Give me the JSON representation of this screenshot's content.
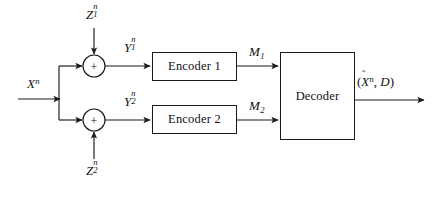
{
  "diagram": {
    "type": "block-diagram",
    "background": "#ffffff",
    "line_color": "#1a1a1a",
    "text_color": "#111111"
  },
  "blocks": [
    {
      "id": "encoder1",
      "label": "Encoder 1",
      "x": 152,
      "y": 52,
      "w": 85,
      "h": 29
    },
    {
      "id": "encoder2",
      "label": "Encoder 2",
      "x": 152,
      "y": 105,
      "w": 85,
      "h": 29
    },
    {
      "id": "decoder",
      "label": "Decoder",
      "x": 280,
      "y": 52,
      "w": 75,
      "h": 88
    }
  ],
  "adders": [
    {
      "id": "adder1",
      "symbol": "+",
      "cx": 94,
      "cy": 66,
      "r": 11
    },
    {
      "id": "adder2",
      "symbol": "+",
      "cx": 94,
      "cy": 120,
      "r": 11
    }
  ],
  "signals": {
    "source": {
      "base": "X",
      "sup": "n",
      "sub": "",
      "text": "Xⁿ"
    },
    "noise_1": {
      "base": "Z",
      "sup": "n",
      "sub": "1",
      "text": "Z₁ⁿ"
    },
    "noise_2": {
      "base": "Z",
      "sup": "n",
      "sub": "2",
      "text": "Z₂ⁿ"
    },
    "observation_1": {
      "base": "Y",
      "sup": "n",
      "sub": "1",
      "text": "Y₁ⁿ"
    },
    "observation_2": {
      "base": "Y",
      "sup": "n",
      "sub": "2",
      "text": "Y₂ⁿ"
    },
    "message_1": {
      "base": "M",
      "sup": "",
      "sub": "1",
      "text": "M₁"
    },
    "message_2": {
      "base": "M",
      "sup": "",
      "sub": "2",
      "text": "M₂"
    },
    "output": {
      "open_paren": "(",
      "estimate": "X",
      "hat": "̂",
      "estimate_sup": "n",
      "comma": ", ",
      "distortion": "D",
      "close_paren": ")",
      "text": "(X̂ⁿ, D)"
    }
  },
  "labels": {
    "z1": {
      "x": 86,
      "y": 6,
      "anchor": "left"
    },
    "x": {
      "x": 27,
      "y": 77,
      "anchor": "left"
    },
    "y1": {
      "x": 124,
      "y": 39,
      "anchor": "left"
    },
    "y2": {
      "x": 124,
      "y": 93,
      "anchor": "left"
    },
    "m1": {
      "x": 249,
      "y": 45,
      "anchor": "left"
    },
    "m2": {
      "x": 249,
      "y": 99,
      "anchor": "left"
    },
    "z2": {
      "x": 86,
      "y": 162,
      "anchor": "left"
    },
    "output": {
      "x": 357,
      "y": 75,
      "anchor": "left"
    }
  },
  "wires": [
    {
      "id": "x-in",
      "from": "source-edge",
      "to": "branch",
      "arrow": true
    },
    {
      "id": "x-branch-up",
      "from": "branch",
      "to": "adder1",
      "arrow": true
    },
    {
      "id": "x-branch-down",
      "from": "branch",
      "to": "adder2",
      "arrow": true
    },
    {
      "id": "z1-in",
      "from": "z1-label",
      "to": "adder1",
      "arrow": true
    },
    {
      "id": "z2-in",
      "from": "z2-label",
      "to": "adder2",
      "arrow": true
    },
    {
      "id": "y1",
      "from": "adder1",
      "to": "encoder1",
      "arrow": true
    },
    {
      "id": "y2",
      "from": "adder2",
      "to": "encoder2",
      "arrow": true
    },
    {
      "id": "m1",
      "from": "encoder1",
      "to": "decoder",
      "arrow": true
    },
    {
      "id": "m2",
      "from": "encoder2",
      "to": "decoder",
      "arrow": true
    },
    {
      "id": "out",
      "from": "decoder",
      "to": "output-edge",
      "arrow": true
    }
  ]
}
